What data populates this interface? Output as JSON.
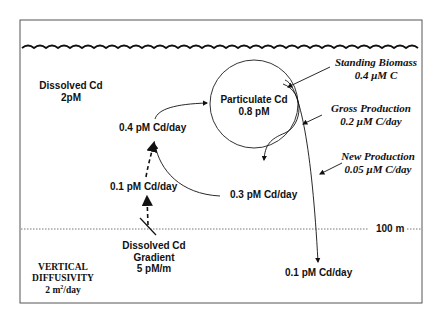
{
  "diagram": {
    "depth_marker": "100 m",
    "dissolved_pool": {
      "title": "Dissolved Cd",
      "value": "2pM"
    },
    "particulate_pool": {
      "title": "Particulate Cd",
      "value": "0.8 pM"
    },
    "standing_biomass": {
      "title": "Standing Biomass",
      "value": "0.4 μM C"
    },
    "gross_production": {
      "title": "Gross Production",
      "value": "0.2 μM C/day"
    },
    "new_production": {
      "title": "New Production",
      "value": "0.05 μM C/day"
    },
    "fluxes": {
      "uptake": "0.4 pM Cd/day",
      "vertical_supply": "0.1 pM Cd/day",
      "regeneration": "0.3 pM Cd/day",
      "export": "0.1 pM Cd/day"
    },
    "gradient": {
      "line1": "Dissolved Cd",
      "line2": "Gradient",
      "value": "5 pM/m"
    },
    "diffusivity": {
      "line1": "VERTICAL",
      "line2": "DIFFUSIVITY",
      "value_prefix": "2 m",
      "value_sup": "2",
      "value_suffix": "/day"
    }
  },
  "colors": {
    "stroke": "#111111",
    "frame": "#555555",
    "dotted": "#777777",
    "background": "#ffffff"
  }
}
